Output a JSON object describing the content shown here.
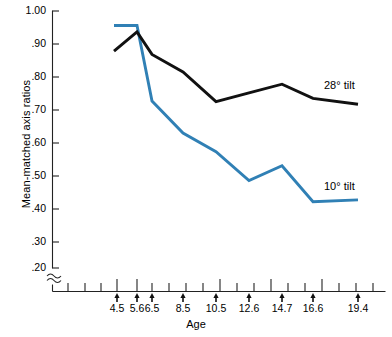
{
  "chart_data": {
    "type": "line",
    "title": "",
    "xlabel": "Age",
    "ylabel": "Mean-matched axis ratios",
    "grid": false,
    "legend_position": "inline-right",
    "axis_break": true,
    "axis_break_symbol": "≈",
    "ylim": [
      0.2,
      1.0
    ],
    "yticks": [
      0.2,
      0.3,
      0.4,
      0.5,
      0.6,
      0.7,
      0.8,
      0.9,
      1.0
    ],
    "ytick_labels": [
      ".20",
      ".30",
      ".40",
      ".50",
      ".60",
      ".70",
      ".80",
      ".90",
      "1.00"
    ],
    "categories": [
      "4.5",
      "5.6",
      "6.5",
      "8.5",
      "10.5",
      "12.6",
      "14.7",
      "16.6",
      "19.4"
    ],
    "xtick_labels": [
      "4.5",
      "5.6",
      "6.5",
      "8.5",
      "10.5",
      "12.6",
      "14.7",
      "16.6",
      "19.4"
    ],
    "x": [
      4.5,
      5.6,
      6.5,
      8.5,
      10.5,
      12.6,
      14.7,
      16.6,
      19.4
    ],
    "series": [
      {
        "name": "28° tilt",
        "color": "#111111",
        "label": "28° tilt",
        "values": [
          0.875,
          0.935,
          0.865,
          0.81,
          0.718,
          0.745,
          0.772,
          0.728,
          0.71
        ]
      },
      {
        "name": "10° tilt",
        "color": "#3080B5",
        "label": "10° tilt",
        "values": [
          0.955,
          0.955,
          0.72,
          0.62,
          0.562,
          0.472,
          0.518,
          0.406,
          0.412
        ]
      }
    ]
  },
  "labels": {
    "y_axis_title": "Mean-matched axis ratios",
    "x_axis_title": "Age",
    "series_28_label": "28° tilt",
    "series_10_label": "10° tilt",
    "ytick_0": "1.00",
    "ytick_1": ".90",
    "ytick_2": ".80",
    "ytick_3": ".70",
    "ytick_4": ".60",
    "ytick_5": ".50",
    "ytick_6": ".40",
    "ytick_7": ".30",
    "ytick_8": ".20",
    "xtick_0": "4.5",
    "xtick_1": "5.6",
    "xtick_2": "6.5",
    "xtick_3": "8.5",
    "xtick_4": "10.5",
    "xtick_5": "12.6",
    "xtick_6": "14.7",
    "xtick_7": "16.6",
    "xtick_8": "19.4"
  }
}
